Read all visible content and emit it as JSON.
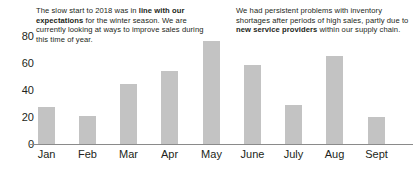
{
  "chart_data": {
    "type": "bar",
    "title": "",
    "xlabel": "",
    "ylabel": "",
    "categories": [
      "Jan",
      "Feb",
      "Mar",
      "Apr",
      "May",
      "June",
      "July",
      "Aug",
      "Sept"
    ],
    "values": [
      27,
      21,
      44,
      54,
      76,
      58,
      29,
      65,
      20
    ],
    "ylim": [
      0,
      80
    ],
    "yticks": [
      0,
      20,
      40,
      60,
      80
    ],
    "ytick_labels": [
      "0",
      "20",
      "40",
      "60",
      "80"
    ],
    "grid": false,
    "legend": "none",
    "bar_color": "#c3c3c3",
    "axis_color": "#8a8a8a",
    "text_color": "#231f20",
    "annotations": [
      {
        "id": "left-commentary",
        "position": "top-left",
        "segments": [
          {
            "text": "The slow start to 2018 was in ",
            "bold": false
          },
          {
            "text": "line with our expectations",
            "bold": true
          },
          {
            "text": " for the winter season. We are currently looking at ways to improve sales during this time of year.",
            "bold": false
          }
        ]
      },
      {
        "id": "right-commentary",
        "position": "top-right",
        "segments": [
          {
            "text": "We had persistent problems with inventory shortages after periods of high sales, partly due to ",
            "bold": false
          },
          {
            "text": "new service providers",
            "bold": true
          },
          {
            "text": " within our supply chain.",
            "bold": false
          }
        ]
      }
    ]
  }
}
